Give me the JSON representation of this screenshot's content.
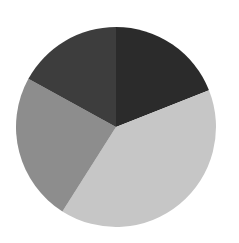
{
  "chart_data": {
    "type": "pie",
    "title": "",
    "start_angle_deg": 0,
    "direction": "clockwise",
    "legend": "none",
    "slices": [
      {
        "label": "Slice 1",
        "value": 19,
        "color": "#2b2b2b"
      },
      {
        "label": "Slice 2",
        "value": 40,
        "color": "#c6c6c6"
      },
      {
        "label": "Slice 3",
        "value": 24,
        "color": "#8d8d8d"
      },
      {
        "label": "Slice 4",
        "value": 17,
        "color": "#3d3d3d"
      }
    ]
  }
}
